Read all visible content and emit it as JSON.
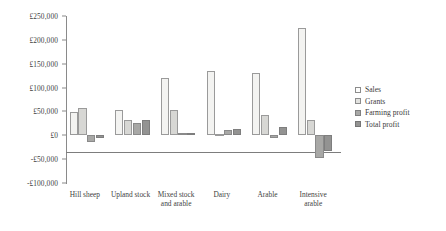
{
  "chart_data": {
    "type": "bar",
    "title": "",
    "subtitle": "",
    "xlabel": "",
    "ylabel": "",
    "grid": false,
    "legend_position": "right",
    "currency": "£",
    "categories": [
      "Hill sheep",
      "Upland stock",
      "Mixed stock and arable",
      "Dairy",
      "Arable",
      "Intensive arable"
    ],
    "series": [
      {
        "name": "Sales",
        "key": "sales",
        "color": "#f3f3f1",
        "values": [
          48000,
          52000,
          120000,
          135000,
          130000,
          225000
        ]
      },
      {
        "name": "Grants",
        "key": "grants",
        "color": "#d7d7d4",
        "values": [
          58000,
          32000,
          52000,
          2000,
          42000,
          33000
        ]
      },
      {
        "name": "Farming profit",
        "key": "farming",
        "color": "#a8a8a6",
        "values": [
          -14000,
          26000,
          4000,
          11000,
          -5000,
          -48000
        ]
      },
      {
        "name": "Total profit",
        "key": "total",
        "color": "#939392",
        "values": [
          -5000,
          31000,
          4000,
          13000,
          18000,
          -33000
        ]
      }
    ],
    "ylim": [
      -100000,
      250000
    ],
    "ytick_step": 50000,
    "yticks": [
      {
        "value": 250000,
        "label": "£250,000"
      },
      {
        "value": 200000,
        "label": "£200,000"
      },
      {
        "value": 150000,
        "label": "£150,000"
      },
      {
        "value": 100000,
        "label": "£100,000"
      },
      {
        "value": 50000,
        "label": "£50,000"
      },
      {
        "value": 0,
        "label": "£0"
      },
      {
        "value": -50000,
        "label": "-£50,000"
      },
      {
        "value": -100000,
        "label": "-£100,000"
      }
    ]
  },
  "legend": {
    "items": [
      {
        "label": "Sales",
        "key": "sales"
      },
      {
        "label": "Grants",
        "key": "grants"
      },
      {
        "label": "Farming profit",
        "key": "farming"
      },
      {
        "label": "Total profit",
        "key": "total"
      }
    ]
  }
}
